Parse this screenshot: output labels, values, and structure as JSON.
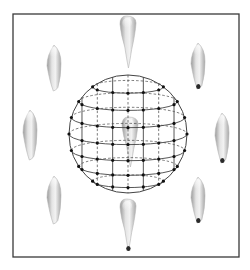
{
  "figure": {
    "frame": {
      "x": 13,
      "y": 14,
      "width": 226,
      "height": 243,
      "stroke": "#3a3a3a"
    },
    "sphere": {
      "cx": 128,
      "cy": 134,
      "r": 59,
      "stroke": "#444444",
      "point_color": "#111111",
      "latitudes": [
        -0.8,
        -0.55,
        -0.28,
        0.0,
        0.28,
        0.55,
        0.8
      ],
      "longitudes": [
        -0.78,
        -0.52,
        -0.26,
        0.0,
        0.26,
        0.52,
        0.78
      ]
    },
    "teeth": [
      {
        "name": "tooth-top",
        "cx": 128,
        "cy": 42,
        "w": 16,
        "h": 52,
        "tilt": 0,
        "style": "incisor"
      },
      {
        "name": "tooth-upper-right",
        "cx": 198,
        "cy": 66,
        "w": 14,
        "h": 46,
        "tilt": 0,
        "style": "canine",
        "dark_tip": true
      },
      {
        "name": "tooth-upper-left",
        "cx": 54,
        "cy": 68,
        "w": 14,
        "h": 46,
        "tilt": 0,
        "style": "canine"
      },
      {
        "name": "tooth-mid-left",
        "cx": 30,
        "cy": 135,
        "w": 14,
        "h": 50,
        "tilt": 0,
        "style": "canine"
      },
      {
        "name": "tooth-mid-right",
        "cx": 222,
        "cy": 138,
        "w": 14,
        "h": 50,
        "tilt": 0,
        "style": "canine",
        "dark_tip": true
      },
      {
        "name": "tooth-lower-left",
        "cx": 54,
        "cy": 200,
        "w": 14,
        "h": 48,
        "tilt": 0,
        "style": "canine"
      },
      {
        "name": "tooth-lower-right",
        "cx": 198,
        "cy": 200,
        "w": 14,
        "h": 46,
        "tilt": 0,
        "style": "canine",
        "dark_tip": true
      },
      {
        "name": "tooth-bottom",
        "cx": 128,
        "cy": 225,
        "w": 16,
        "h": 52,
        "tilt": 0,
        "style": "incisor",
        "dark_tip": true
      },
      {
        "name": "tooth-center",
        "cx": 130,
        "cy": 142,
        "w": 16,
        "h": 50,
        "tilt": 0,
        "style": "incisor"
      }
    ]
  }
}
